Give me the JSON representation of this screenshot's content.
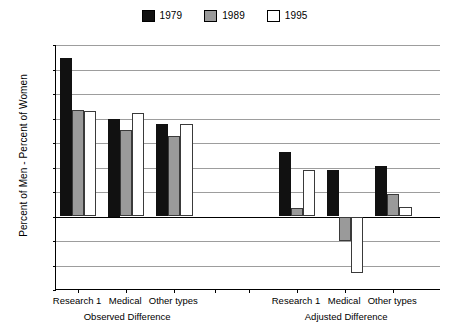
{
  "chart_data": {
    "type": "bar",
    "title": "",
    "xlabel": "",
    "ylabel": "Percent of Men - Percent of Women",
    "ylim": [
      -15,
      35
    ],
    "ytick_step": 5,
    "yticks": [
      "35",
      "30",
      "25",
      "20",
      "15",
      "10",
      "5",
      "0",
      "-5",
      "-10",
      "-15"
    ],
    "grid": true,
    "legend_position": "top-center",
    "legend": [
      "1979",
      "1989",
      "1995"
    ],
    "panels": [
      {
        "name": "Observed Difference",
        "categories": [
          "Research 1",
          "Medical",
          "Other types"
        ],
        "series": [
          {
            "name": "1979",
            "values": [
              32.3,
              20.0,
              18.8
            ]
          },
          {
            "name": "1989",
            "values": [
              21.8,
              17.6,
              16.5
            ]
          },
          {
            "name": "1995",
            "values": [
              21.6,
              21.1,
              18.8
            ]
          }
        ]
      },
      {
        "name": "Adjusted Difference",
        "categories": [
          "Research 1",
          "Medical",
          "Other types"
        ],
        "series": [
          {
            "name": "1979",
            "values": [
              13.1,
              9.5,
              10.3
            ]
          },
          {
            "name": "1989",
            "values": [
              1.8,
              -5.0,
              4.6
            ]
          },
          {
            "name": "1995",
            "values": [
              9.4,
              -11.5,
              1.9
            ]
          }
        ]
      }
    ],
    "colors": {
      "1979": "#111111",
      "1989": "#9a9a9a",
      "1995": "#ffffff",
      "grid": "#9d9d9d",
      "axis": "#000000"
    }
  }
}
